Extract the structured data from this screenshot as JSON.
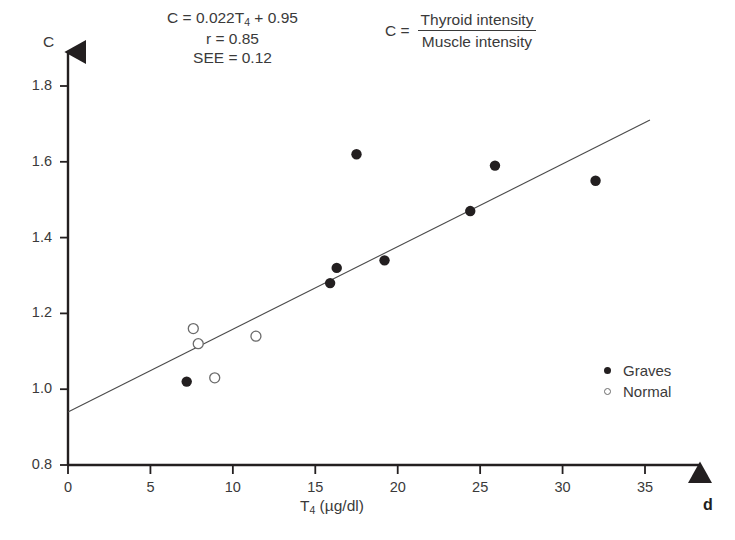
{
  "annotations": {
    "equation": "C = 0.022T",
    "equation_sub": "4",
    "equation_tail": " + 0.95",
    "r_line": "r = 0.85",
    "see_line": "SEE = 0.12",
    "ratio_lhs": "C =",
    "ratio_numerator": "Thyroid intensity",
    "ratio_denominator": "Muscle intensity",
    "corner_label": "d"
  },
  "chart_data": {
    "type": "scatter",
    "title": "",
    "xlabel": "T4 (µg/dl)",
    "xlabel_base": "T",
    "xlabel_sub": "4",
    "xlabel_unit": " (µg/dl)",
    "ylabel": "C",
    "xlim": [
      0,
      35
    ],
    "ylim": [
      0.8,
      1.8
    ],
    "grid": false,
    "legend_position": "right-middle",
    "xticks": [
      0,
      5,
      10,
      15,
      20,
      25,
      30,
      35
    ],
    "xtick_labels": [
      "0",
      "5",
      "10",
      "15",
      "20",
      "25",
      "30",
      "35"
    ],
    "yticks": [
      0.8,
      1.0,
      1.2,
      1.4,
      1.6,
      1.8
    ],
    "ytick_labels": [
      "0.8",
      "1.0",
      "1.2",
      "1.4",
      "1.6",
      "1.8"
    ],
    "series": [
      {
        "name": "Graves",
        "marker": "filled-circle",
        "color": "#231f20",
        "points": [
          {
            "x": 7.2,
            "y": 1.02
          },
          {
            "x": 15.9,
            "y": 1.28
          },
          {
            "x": 16.3,
            "y": 1.32
          },
          {
            "x": 17.5,
            "y": 1.62
          },
          {
            "x": 19.2,
            "y": 1.34
          },
          {
            "x": 24.4,
            "y": 1.47
          },
          {
            "x": 25.9,
            "y": 1.59
          },
          {
            "x": 32.0,
            "y": 1.55
          }
        ]
      },
      {
        "name": "Normal",
        "marker": "open-circle",
        "color": "#6b6b6b",
        "points": [
          {
            "x": 7.6,
            "y": 1.16
          },
          {
            "x": 7.9,
            "y": 1.12
          },
          {
            "x": 8.9,
            "y": 1.03
          },
          {
            "x": 11.4,
            "y": 1.14
          }
        ]
      }
    ],
    "trendline": {
      "slope": 0.022,
      "intercept": 0.95,
      "r": 0.85,
      "see": 0.12,
      "x_start": 0,
      "y_start": 0.94,
      "x_end": 35.3,
      "y_end": 1.71,
      "color": "#4a4a4a"
    }
  },
  "legend": {
    "items": [
      {
        "label": "Graves",
        "marker": "filled-circle"
      },
      {
        "label": "Normal",
        "marker": "open-circle"
      }
    ]
  }
}
